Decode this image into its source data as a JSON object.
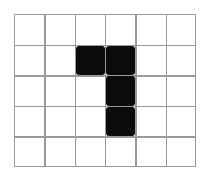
{
  "figure": {
    "shape_name": "J-tetromino",
    "background_color": "#ffffff"
  },
  "grid": {
    "columns": 6,
    "rows": 5,
    "line_color": "#9a9a9a",
    "line_width_px": 1.4,
    "origin_x_px": 14,
    "origin_y_px": 14,
    "width_px": 182,
    "height_px": 153,
    "cell_width_px": 30.33,
    "cell_height_px": 30.6,
    "column_ticks": [
      0,
      1,
      2,
      3,
      4,
      5,
      6
    ],
    "row_ticks": [
      0,
      1,
      2,
      3,
      4,
      5
    ]
  },
  "shape": {
    "fill_color": "#0b0b0b",
    "cell_count": 4,
    "cells": [
      {
        "row": 1,
        "col": 2,
        "label": "arm-left"
      },
      {
        "row": 1,
        "col": 3,
        "label": "corner"
      },
      {
        "row": 2,
        "col": 3,
        "label": "stem-middle"
      },
      {
        "row": 3,
        "col": 3,
        "label": "stem-bottom"
      }
    ],
    "occupancy_matrix": [
      [
        0,
        0,
        0,
        0,
        0,
        0
      ],
      [
        0,
        0,
        1,
        1,
        0,
        0
      ],
      [
        0,
        0,
        0,
        1,
        0,
        0
      ],
      [
        0,
        0,
        0,
        1,
        0,
        0
      ],
      [
        0,
        0,
        0,
        0,
        0,
        0
      ]
    ]
  }
}
